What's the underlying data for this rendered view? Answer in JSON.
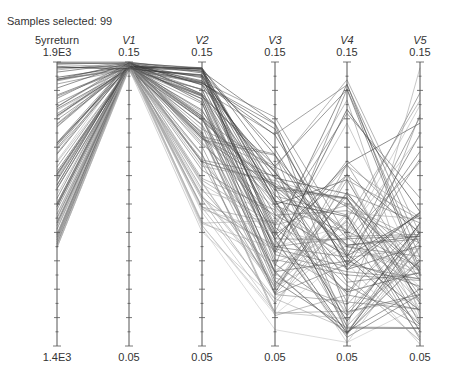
{
  "status": {
    "label": "Samples selected:",
    "count": "99",
    "text": "Samples selected: 99"
  },
  "axes": [
    {
      "name": "5yrreturn",
      "max": "1.9E3",
      "min": "1.4E3",
      "x": 57,
      "italic": false
    },
    {
      "name": "V1",
      "max": "0.15",
      "min": "0.05",
      "x": 129,
      "italic": true
    },
    {
      "name": "V2",
      "max": "0.15",
      "min": "0.05",
      "x": 202,
      "italic": true
    },
    {
      "name": "V3",
      "max": "0.15",
      "min": "0.05",
      "x": 275,
      "italic": true
    },
    {
      "name": "V4",
      "max": "0.15",
      "min": "0.05",
      "x": 347,
      "italic": true
    },
    {
      "name": "V5",
      "max": "0.15",
      "min": "0.05",
      "x": 420,
      "italic": true
    }
  ],
  "colors": {
    "axis": "#555555",
    "line_dark": "#2a2a2a",
    "line_light": "#bdbdbd"
  },
  "chart_data": {
    "type": "parallel_coordinates",
    "title": "",
    "samples_selected": 99,
    "dimensions": [
      "5yrreturn",
      "V1",
      "V2",
      "V3",
      "V4",
      "V5"
    ],
    "ranges": {
      "5yrreturn": [
        1400,
        1900
      ],
      "V1": [
        0.05,
        0.15
      ],
      "V2": [
        0.05,
        0.15
      ],
      "V3": [
        0.05,
        0.15
      ],
      "V4": [
        0.05,
        0.15
      ],
      "V5": [
        0.05,
        0.15
      ]
    },
    "distribution_summary": {
      "5yrreturn": {
        "low": 1570,
        "high": 1900,
        "note": "samples spread from ~1.57E3 to 1.9E3"
      },
      "V1": {
        "low": 0.143,
        "high": 0.15,
        "note": "nearly all samples at top ~0.15"
      },
      "V2": {
        "low": 0.09,
        "high": 0.15,
        "note": "concentrated 0.11-0.15"
      },
      "V3": {
        "low": 0.05,
        "high": 0.13,
        "note": "spread, many near 0.07-0.11"
      },
      "V4": {
        "low": 0.05,
        "high": 0.15,
        "note": "full range, denser low"
      },
      "V5": {
        "low": 0.05,
        "high": 0.148,
        "note": "full range, denser low 0.05-0.09"
      }
    },
    "ticks_per_axis": 21,
    "grid": false,
    "legend": "none"
  }
}
